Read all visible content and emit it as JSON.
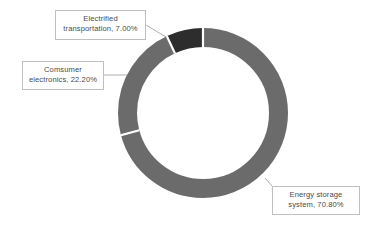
{
  "chart_data": {
    "type": "pie",
    "variant": "donut",
    "title": "",
    "subtitle": "",
    "xlabel": "",
    "ylabel": "",
    "legend_position": "none",
    "grid": false,
    "labels_style": "callout-boxes-with-leader-lines",
    "units": "percent",
    "total": 100.0,
    "start_angle_deg": 0,
    "direction": "clockwise",
    "categories": [
      "Energy storage system",
      "Comsumer electronics",
      "Electrified transportation"
    ],
    "values": [
      70.8,
      22.2,
      7.0
    ],
    "slices": [
      {
        "name": "Energy storage system",
        "value": 70.8,
        "value_label": "70.80%",
        "callout_line1": "Energy storage",
        "callout_line2": "system, 70.80%",
        "color": "#6b6b6b",
        "start_deg": 0,
        "end_deg": 254.88
      },
      {
        "name": "Comsumer electronics",
        "value": 22.2,
        "value_label": "22.20%",
        "callout_line1": "Comsumer",
        "callout_line2": "electronics, 22.20%",
        "color": "#6b6b6b",
        "start_deg": 254.88,
        "end_deg": 334.8
      },
      {
        "name": "Electrified transportation",
        "value": 7.0,
        "value_label": "7.00%",
        "callout_line1": "Electrified",
        "callout_line2": "transportation, 7.00%",
        "color": "#2d2d2d",
        "start_deg": 334.8,
        "end_deg": 360.0
      }
    ],
    "colors": {
      "primary_gray": "#6b6b6b",
      "dark_gray": "#2d2d2d",
      "divider": "#ffffff",
      "background": "#ffffff",
      "callout_border": "#bfbfbf",
      "callout_text": "#4a4a4a",
      "leader_line": "#9a9a9a"
    }
  }
}
